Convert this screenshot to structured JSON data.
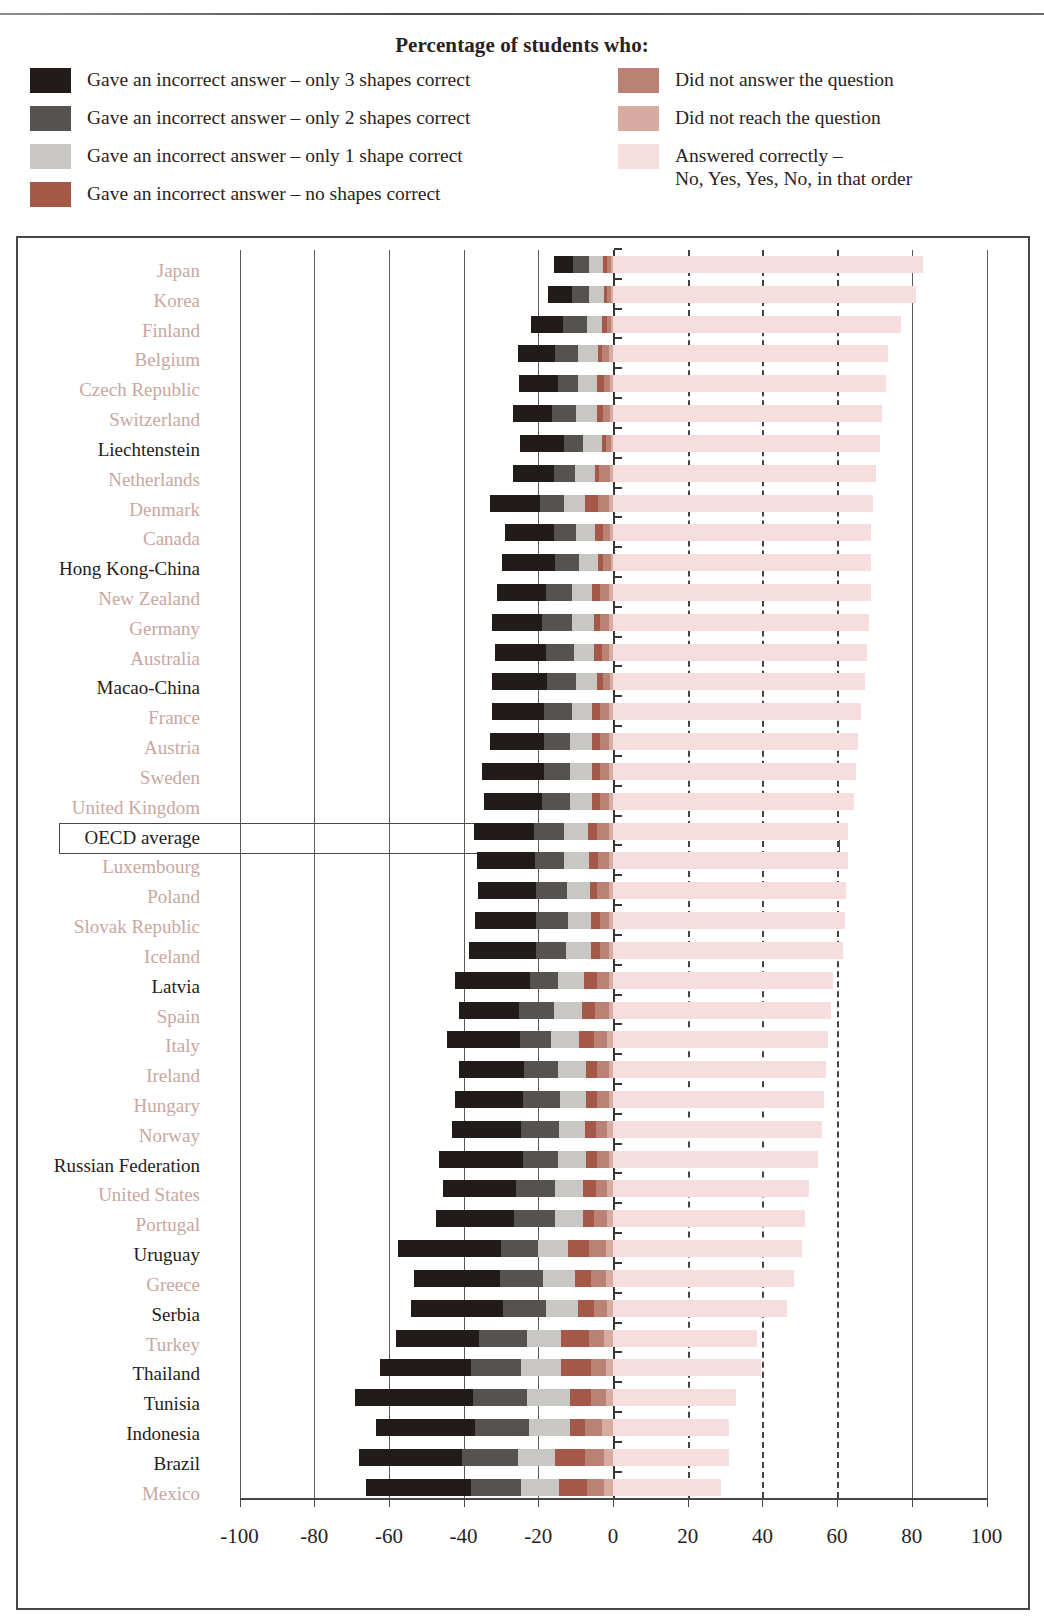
{
  "legend": {
    "title": "Percentage of students who:",
    "left_items": [
      {
        "label": "Gave an incorrect answer – only 3 shapes correct",
        "color": "#211b19",
        "key": "only3"
      },
      {
        "label": "Gave an incorrect answer – only 2 shapes correct",
        "color": "#56524f",
        "key": "only2"
      },
      {
        "label": "Gave an incorrect answer – only 1 shape correct",
        "color": "#c9c7c4",
        "key": "only1"
      },
      {
        "label": "Gave an incorrect answer – no shapes correct",
        "color": "#a55847",
        "key": "none"
      }
    ],
    "right_items": [
      {
        "label": "Did not answer the question",
        "color": "#b98274",
        "key": "no_answer"
      },
      {
        "label": "Did not reach the question",
        "color": "#d5aba2",
        "key": "not_reached"
      },
      {
        "label": "Answered correctly –\nNo, Yes, Yes, No, in that order",
        "color": "#f6dede",
        "key": "correct"
      }
    ]
  },
  "chart_data": {
    "type": "bar",
    "subtype": "diverging-stacked-horizontal",
    "title": "Percentage of students who:",
    "xlabel": "",
    "ylabel": "",
    "xlim": [
      -100,
      100
    ],
    "xticks": [
      -100,
      -80,
      -60,
      -40,
      -20,
      0,
      20,
      40,
      60,
      80,
      100
    ],
    "xticklabels": [
      "-100",
      "-80",
      "-60",
      "-40",
      "-20",
      "0",
      "20",
      "40",
      "60",
      "80",
      "100"
    ],
    "grid": true,
    "gridlines_solid": [
      -100,
      -80,
      -60,
      -40,
      -20,
      0,
      80,
      100
    ],
    "gridlines_dashed": [
      20,
      40,
      60
    ],
    "legend_position": "top",
    "series": [
      {
        "name": "Gave an incorrect answer – only 3 shapes correct",
        "key": "only3",
        "color": "#211b19",
        "side": "negative"
      },
      {
        "name": "Gave an incorrect answer – only 2 shapes correct",
        "key": "only2",
        "color": "#56524f",
        "side": "negative"
      },
      {
        "name": "Gave an incorrect answer – only 1 shape correct",
        "key": "only1",
        "color": "#c9c7c4",
        "side": "negative"
      },
      {
        "name": "Gave an incorrect answer – no shapes correct",
        "key": "none",
        "color": "#a55847",
        "side": "negative"
      },
      {
        "name": "Did not answer the question",
        "key": "no_answer",
        "color": "#b98274",
        "side": "negative"
      },
      {
        "name": "Did not reach the question",
        "key": "not_reached",
        "color": "#d5aba2",
        "side": "negative"
      },
      {
        "name": "Answered correctly – No, Yes, Yes, No, in that order",
        "key": "correct",
        "color": "#f6dede",
        "side": "positive"
      }
    ],
    "categories": [
      "Japan",
      "Korea",
      "Finland",
      "Belgium",
      "Czech Republic",
      "Switzerland",
      "Liechtenstein",
      "Netherlands",
      "Denmark",
      "Canada",
      "Hong Kong-China",
      "New Zealand",
      "Germany",
      "Australia",
      "Macao-China",
      "France",
      "Austria",
      "Sweden",
      "United Kingdom",
      "OECD average",
      "Luxembourg",
      "Poland",
      "Slovak Republic",
      "Iceland",
      "Latvia",
      "Spain",
      "Italy",
      "Ireland",
      "Hungary",
      "Norway",
      "Russian Federation",
      "United States",
      "Portugal",
      "Uruguay",
      "Greece",
      "Serbia",
      "Turkey",
      "Thailand",
      "Tunisia",
      "Indonesia",
      "Brazil",
      "Mexico"
    ],
    "rows": [
      {
        "country": "Japan",
        "oecd": true,
        "only3": 5.0,
        "only2": 4.5,
        "only1": 3.5,
        "none": 1.2,
        "no_answer": 1.0,
        "not_reached": 0.6,
        "correct": 83.0
      },
      {
        "country": "Korea",
        "oecd": true,
        "only3": 6.5,
        "only2": 4.5,
        "only1": 4.0,
        "none": 1.0,
        "no_answer": 1.0,
        "not_reached": 0.5,
        "correct": 81.0
      },
      {
        "country": "Finland",
        "oecd": true,
        "only3": 8.5,
        "only2": 6.5,
        "only1": 4.0,
        "none": 1.5,
        "no_answer": 1.0,
        "not_reached": 0.5,
        "correct": 77.0
      },
      {
        "country": "Belgium",
        "oecd": true,
        "only3": 10.0,
        "only2": 6.0,
        "only1": 5.5,
        "none": 1.0,
        "no_answer": 2.0,
        "not_reached": 1.0,
        "correct": 73.5
      },
      {
        "country": "Czech Republic",
        "oecd": true,
        "only3": 10.5,
        "only2": 5.5,
        "only1": 5.0,
        "none": 2.0,
        "no_answer": 1.5,
        "not_reached": 0.8,
        "correct": 73.0
      },
      {
        "country": "Switzerland",
        "oecd": true,
        "only3": 10.5,
        "only2": 6.5,
        "only1": 5.5,
        "none": 1.5,
        "no_answer": 2.0,
        "not_reached": 0.8,
        "correct": 72.0
      },
      {
        "country": "Liechtenstein",
        "oecd": false,
        "only3": 12.0,
        "only2": 5.0,
        "only1": 5.0,
        "none": 1.0,
        "no_answer": 1.5,
        "not_reached": 0.5,
        "correct": 71.5
      },
      {
        "country": "Netherlands",
        "oecd": true,
        "only3": 11.0,
        "only2": 5.5,
        "only1": 5.5,
        "none": 1.0,
        "no_answer": 3.0,
        "not_reached": 0.8,
        "correct": 70.5
      },
      {
        "country": "Denmark",
        "oecd": true,
        "only3": 13.5,
        "only2": 6.5,
        "only1": 5.5,
        "none": 3.5,
        "no_answer": 3.0,
        "not_reached": 1.0,
        "correct": 69.5
      },
      {
        "country": "Canada",
        "oecd": true,
        "only3": 13.0,
        "only2": 6.0,
        "only1": 5.0,
        "none": 2.0,
        "no_answer": 2.0,
        "not_reached": 0.8,
        "correct": 69.0
      },
      {
        "country": "Hong Kong-China",
        "oecd": false,
        "only3": 14.0,
        "only2": 6.5,
        "only1": 5.0,
        "none": 1.5,
        "no_answer": 2.0,
        "not_reached": 0.6,
        "correct": 69.0
      },
      {
        "country": "New Zealand",
        "oecd": true,
        "only3": 13.0,
        "only2": 7.0,
        "only1": 5.5,
        "none": 2.0,
        "no_answer": 2.5,
        "not_reached": 1.0,
        "correct": 69.0
      },
      {
        "country": "Germany",
        "oecd": true,
        "only3": 13.5,
        "only2": 8.0,
        "only1": 6.0,
        "none": 1.5,
        "no_answer": 2.5,
        "not_reached": 1.0,
        "correct": 68.5
      },
      {
        "country": "Australia",
        "oecd": true,
        "only3": 13.5,
        "only2": 7.5,
        "only1": 5.5,
        "none": 2.0,
        "no_answer": 2.0,
        "not_reached": 1.0,
        "correct": 68.0
      },
      {
        "country": "Macao-China",
        "oecd": false,
        "only3": 14.5,
        "only2": 8.0,
        "only1": 5.5,
        "none": 1.5,
        "no_answer": 2.0,
        "not_reached": 0.8,
        "correct": 67.5
      },
      {
        "country": "France",
        "oecd": true,
        "only3": 14.0,
        "only2": 7.5,
        "only1": 5.5,
        "none": 2.0,
        "no_answer": 2.5,
        "not_reached": 1.0,
        "correct": 66.5
      },
      {
        "country": "Austria",
        "oecd": true,
        "only3": 14.5,
        "only2": 7.0,
        "only1": 6.0,
        "none": 2.0,
        "no_answer": 2.5,
        "not_reached": 1.0,
        "correct": 65.5
      },
      {
        "country": "Sweden",
        "oecd": true,
        "only3": 16.5,
        "only2": 7.0,
        "only1": 6.0,
        "none": 2.0,
        "no_answer": 2.5,
        "not_reached": 1.0,
        "correct": 65.0
      },
      {
        "country": "United Kingdom",
        "oecd": true,
        "only3": 15.5,
        "only2": 7.5,
        "only1": 6.0,
        "none": 2.0,
        "no_answer": 2.5,
        "not_reached": 1.0,
        "correct": 64.5
      },
      {
        "country": "OECD average",
        "oecd": true,
        "only3": 16.0,
        "only2": 8.0,
        "only1": 6.5,
        "none": 2.5,
        "no_answer": 3.0,
        "not_reached": 1.2,
        "correct": 63.0
      },
      {
        "country": "Luxembourg",
        "oecd": true,
        "only3": 15.5,
        "only2": 8.0,
        "only1": 6.5,
        "none": 2.5,
        "no_answer": 3.0,
        "not_reached": 1.0,
        "correct": 63.0
      },
      {
        "country": "Poland",
        "oecd": true,
        "only3": 15.5,
        "only2": 8.5,
        "only1": 6.0,
        "none": 2.0,
        "no_answer": 3.0,
        "not_reached": 1.2,
        "correct": 62.5
      },
      {
        "country": "Slovak Republic",
        "oecd": true,
        "only3": 16.5,
        "only2": 8.5,
        "only1": 6.0,
        "none": 2.5,
        "no_answer": 2.5,
        "not_reached": 1.0,
        "correct": 62.0
      },
      {
        "country": "Iceland",
        "oecd": true,
        "only3": 18.0,
        "only2": 8.0,
        "only1": 6.5,
        "none": 2.5,
        "no_answer": 2.5,
        "not_reached": 1.0,
        "correct": 61.5
      },
      {
        "country": "Latvia",
        "oecd": false,
        "only3": 20.0,
        "only2": 7.5,
        "only1": 7.0,
        "none": 3.5,
        "no_answer": 3.0,
        "not_reached": 1.2,
        "correct": 59.0
      },
      {
        "country": "Spain",
        "oecd": true,
        "only3": 16.0,
        "only2": 9.5,
        "only1": 7.5,
        "none": 3.5,
        "no_answer": 3.5,
        "not_reached": 1.2,
        "correct": 58.5
      },
      {
        "country": "Italy",
        "oecd": true,
        "only3": 19.5,
        "only2": 8.5,
        "only1": 7.5,
        "none": 4.0,
        "no_answer": 3.5,
        "not_reached": 1.5,
        "correct": 57.5
      },
      {
        "country": "Ireland",
        "oecd": true,
        "only3": 17.5,
        "only2": 9.0,
        "only1": 7.5,
        "none": 3.0,
        "no_answer": 3.0,
        "not_reached": 1.2,
        "correct": 57.0
      },
      {
        "country": "Hungary",
        "oecd": true,
        "only3": 18.0,
        "only2": 10.0,
        "only1": 7.0,
        "none": 3.0,
        "no_answer": 3.0,
        "not_reached": 1.2,
        "correct": 56.5
      },
      {
        "country": "Norway",
        "oecd": true,
        "only3": 18.5,
        "only2": 10.0,
        "only1": 7.0,
        "none": 3.0,
        "no_answer": 3.0,
        "not_reached": 1.5,
        "correct": 56.0
      },
      {
        "country": "Russian Federation",
        "oecd": false,
        "only3": 22.5,
        "only2": 9.5,
        "only1": 7.5,
        "none": 3.0,
        "no_answer": 3.0,
        "not_reached": 1.2,
        "correct": 55.0
      },
      {
        "country": "United States",
        "oecd": true,
        "only3": 19.5,
        "only2": 10.5,
        "only1": 7.5,
        "none": 3.5,
        "no_answer": 3.0,
        "not_reached": 1.5,
        "correct": 52.5
      },
      {
        "country": "Portugal",
        "oecd": true,
        "only3": 21.0,
        "only2": 11.0,
        "only1": 7.5,
        "none": 3.0,
        "no_answer": 3.5,
        "not_reached": 1.5,
        "correct": 51.5
      },
      {
        "country": "Uruguay",
        "oecd": false,
        "only3": 27.5,
        "only2": 10.0,
        "only1": 8.0,
        "none": 5.5,
        "no_answer": 4.5,
        "not_reached": 2.0,
        "correct": 50.5
      },
      {
        "country": "Greece",
        "oecd": true,
        "only3": 23.0,
        "only2": 11.5,
        "only1": 8.5,
        "none": 4.5,
        "no_answer": 4.0,
        "not_reached": 1.8,
        "correct": 48.5
      },
      {
        "country": "Serbia",
        "oecd": false,
        "only3": 24.5,
        "only2": 11.5,
        "only1": 8.5,
        "none": 4.5,
        "no_answer": 3.5,
        "not_reached": 1.5,
        "correct": 46.5
      },
      {
        "country": "Turkey",
        "oecd": true,
        "only3": 22.0,
        "only2": 13.0,
        "only1": 9.0,
        "none": 7.5,
        "no_answer": 4.0,
        "not_reached": 2.5,
        "correct": 38.5
      },
      {
        "country": "Thailand",
        "oecd": false,
        "only3": 24.5,
        "only2": 13.5,
        "only1": 10.5,
        "none": 8.0,
        "no_answer": 4.0,
        "not_reached": 2.0,
        "correct": 39.5
      },
      {
        "country": "Tunisia",
        "oecd": false,
        "only3": 31.5,
        "only2": 14.5,
        "only1": 11.5,
        "none": 5.5,
        "no_answer": 4.0,
        "not_reached": 2.0,
        "correct": 33.0
      },
      {
        "country": "Indonesia",
        "oecd": false,
        "only3": 26.5,
        "only2": 14.5,
        "only1": 11.0,
        "none": 4.0,
        "no_answer": 4.5,
        "not_reached": 3.0,
        "correct": 31.0
      },
      {
        "country": "Brazil",
        "oecd": false,
        "only3": 27.5,
        "only2": 15.0,
        "only1": 10.0,
        "none": 8.0,
        "no_answer": 5.0,
        "not_reached": 2.5,
        "correct": 31.0
      },
      {
        "country": "Mexico",
        "oecd": true,
        "only3": 28.0,
        "only2": 13.5,
        "only1": 10.0,
        "none": 7.5,
        "no_answer": 4.5,
        "not_reached": 2.5,
        "correct": 29.0
      }
    ]
  },
  "highlight": {
    "row": "OECD average"
  }
}
